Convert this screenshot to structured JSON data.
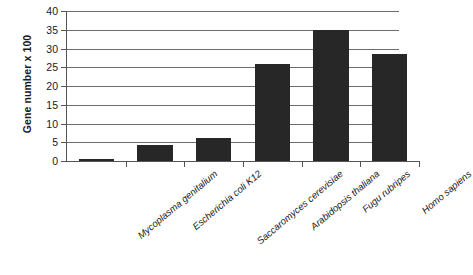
{
  "chart_data": {
    "type": "bar",
    "title": "",
    "xlabel": "",
    "ylabel": "Gene number x 100",
    "ylim": [
      0,
      40
    ],
    "ytick_step": 5,
    "ytick_labels": [
      "0",
      "5",
      "10",
      "15",
      "20",
      "25",
      "30",
      "35",
      "40"
    ],
    "grid": true,
    "legend": "none",
    "bar_color": "#272727",
    "axis_color": "#555555",
    "gridline_color": "#6d6d6d",
    "categories": [
      "Mycoplasma genitalium",
      "Escherichia coli K12",
      "Saccaromyces cerevisiae",
      "Arabidopsis thaliana",
      "Fugu rubripes",
      "Homo sapiens"
    ],
    "values": [
      0.5,
      4.3,
      6.2,
      25.8,
      35.0,
      28.5
    ]
  }
}
